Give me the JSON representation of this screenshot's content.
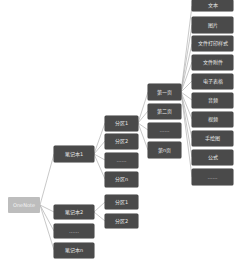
{
  "diagram": {
    "type": "mind-map-tree",
    "colors": {
      "root_fill": "#bdbdbd",
      "node_fill": "#4a4a4a",
      "text": "#e8e8e8",
      "edge": "#b0b0b0",
      "background": "#ffffff"
    },
    "root": {
      "id": "onenote",
      "label": "OneNote"
    },
    "notebooks": [
      {
        "id": "nb1",
        "label": "笔记本1"
      },
      {
        "id": "nb2",
        "label": "笔记本2"
      },
      {
        "id": "nb-ellipsis",
        "label": "……"
      },
      {
        "id": "nbn",
        "label": "笔记本n"
      }
    ],
    "sections_nb1": [
      {
        "id": "s1",
        "label": "分区1"
      },
      {
        "id": "s2",
        "label": "分区2"
      },
      {
        "id": "s-ellipsis",
        "label": "……"
      },
      {
        "id": "sn",
        "label": "分区n"
      }
    ],
    "sections_nb2": [
      {
        "id": "s2-1",
        "label": "分区1"
      },
      {
        "id": "s2-2",
        "label": "分区2"
      }
    ],
    "pages": [
      {
        "id": "p1",
        "label": "第一页"
      },
      {
        "id": "p2",
        "label": "第二页"
      },
      {
        "id": "p-ellipsis",
        "label": "……"
      },
      {
        "id": "pn",
        "label": "第n页"
      }
    ],
    "content_types": [
      {
        "id": "c-text",
        "label": "文本"
      },
      {
        "id": "c-image",
        "label": "图片"
      },
      {
        "id": "c-printout",
        "label": "文件打印样式"
      },
      {
        "id": "c-attachment",
        "label": "文件附件"
      },
      {
        "id": "c-spreadsheet",
        "label": "电子表格"
      },
      {
        "id": "c-audio",
        "label": "音频"
      },
      {
        "id": "c-video",
        "label": "视频"
      },
      {
        "id": "c-drawing",
        "label": "手绘图"
      },
      {
        "id": "c-equation",
        "label": "公式"
      },
      {
        "id": "c-ellipsis",
        "label": "……"
      }
    ],
    "edges": [
      [
        "onenote",
        "nb1"
      ],
      [
        "onenote",
        "nb2"
      ],
      [
        "onenote",
        "nb-ellipsis"
      ],
      [
        "onenote",
        "nbn"
      ],
      [
        "nb1",
        "s1"
      ],
      [
        "nb1",
        "s2"
      ],
      [
        "nb1",
        "s-ellipsis"
      ],
      [
        "nb1",
        "sn"
      ],
      [
        "nb2",
        "s2-1"
      ],
      [
        "nb2",
        "s2-2"
      ],
      [
        "s1",
        "p1"
      ],
      [
        "s1",
        "p2"
      ],
      [
        "s1",
        "p-ellipsis"
      ],
      [
        "s1",
        "pn"
      ],
      [
        "p1",
        "c-text"
      ],
      [
        "p1",
        "c-image"
      ],
      [
        "p1",
        "c-printout"
      ],
      [
        "p1",
        "c-attachment"
      ],
      [
        "p1",
        "c-spreadsheet"
      ],
      [
        "p1",
        "c-audio"
      ],
      [
        "p1",
        "c-video"
      ],
      [
        "p1",
        "c-drawing"
      ],
      [
        "p1",
        "c-equation"
      ],
      [
        "p1",
        "c-ellipsis"
      ]
    ]
  }
}
